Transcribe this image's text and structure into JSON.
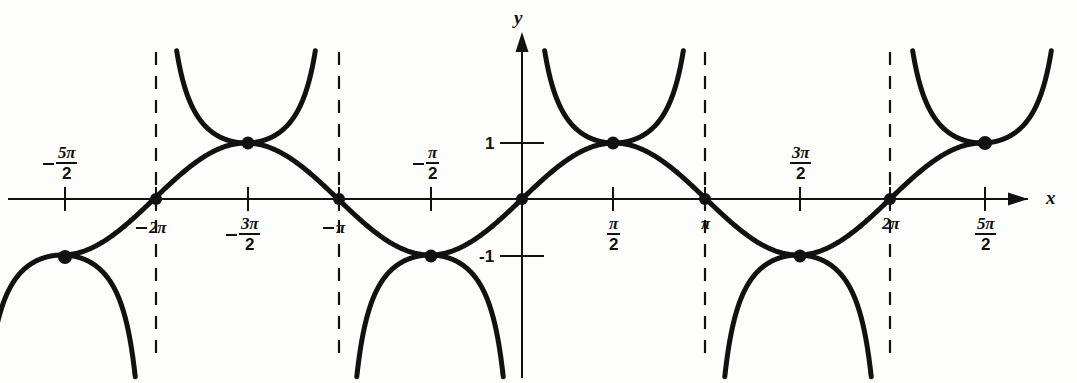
{
  "figure": {
    "background_color": "#fdfdfb",
    "ink_color": "#111111",
    "width": 1077,
    "height": 383
  },
  "axes": {
    "x_axis_name": "x",
    "y_axis_name": "y",
    "origin_px": {
      "x": 522,
      "y": 199
    },
    "pixels_per_half_pi": 92,
    "pixels_per_unit_y": 56,
    "x_range_pi": [
      -3.0,
      3.0
    ],
    "y_range": [
      -3.2,
      2.7
    ],
    "grid": false
  },
  "x_ticks": [
    {
      "id": "neg-5pi-2",
      "label_parts": {
        "sign": "-",
        "numerator": "5π",
        "denominator": "2"
      },
      "label_text": "-5π/2",
      "x_px": 65,
      "value_pi": -2.5,
      "label_side": "above"
    },
    {
      "id": "neg-2pi",
      "label_parts": {
        "sign": "-",
        "numerator": "2π",
        "denominator": ""
      },
      "label_text": "-2π",
      "x_px": 156,
      "value_pi": -2.0,
      "label_side": "below"
    },
    {
      "id": "neg-3pi-2",
      "label_parts": {
        "sign": "-",
        "numerator": "3π",
        "denominator": "2"
      },
      "label_text": "-3π/2",
      "x_px": 248,
      "value_pi": -1.5,
      "label_side": "below"
    },
    {
      "id": "neg-pi",
      "label_parts": {
        "sign": "-",
        "numerator": "π",
        "denominator": ""
      },
      "label_text": "-π",
      "x_px": 339,
      "value_pi": -1.0,
      "label_side": "below"
    },
    {
      "id": "neg-pi-2",
      "label_parts": {
        "sign": "-",
        "numerator": "π",
        "denominator": "2"
      },
      "label_text": "-π/2",
      "x_px": 431,
      "value_pi": -0.5,
      "label_side": "above"
    },
    {
      "id": "pos-pi-2",
      "label_parts": {
        "sign": "",
        "numerator": "π",
        "denominator": "2"
      },
      "label_text": "π/2",
      "x_px": 613,
      "value_pi": 0.5,
      "label_side": "below"
    },
    {
      "id": "pos-pi",
      "label_parts": {
        "sign": "",
        "numerator": "π",
        "denominator": ""
      },
      "label_text": "π",
      "x_px": 705,
      "value_pi": 1.0,
      "label_side": "below"
    },
    {
      "id": "pos-3pi-2",
      "label_parts": {
        "sign": "",
        "numerator": "3π",
        "denominator": "2"
      },
      "label_text": "3π/2",
      "x_px": 800,
      "value_pi": 1.5,
      "label_side": "above"
    },
    {
      "id": "pos-2pi",
      "label_parts": {
        "sign": "",
        "numerator": "2π",
        "denominator": ""
      },
      "label_text": "2π",
      "x_px": 890,
      "value_pi": 2.0,
      "label_side": "below"
    },
    {
      "id": "pos-5pi-2",
      "label_parts": {
        "sign": "",
        "numerator": "5π",
        "denominator": "2"
      },
      "label_text": "5π/2",
      "x_px": 985,
      "value_pi": 2.5,
      "label_side": "below"
    }
  ],
  "y_ticks": [
    {
      "id": "y-pos-1",
      "label_text": "1",
      "value": 1,
      "y_px": 143
    },
    {
      "id": "y-neg-1",
      "label_text": "-1",
      "value": -1,
      "y_px": 256
    }
  ],
  "asymptotes": {
    "style": "dashed",
    "label": "vertical asymptotes of csc x",
    "x_values_pi": [
      -2.0,
      -1.0,
      1.0,
      2.0
    ],
    "x_px": [
      156,
      339,
      705,
      890
    ],
    "top_px": 52,
    "bottom_px": 356
  },
  "tangency_points": [
    {
      "label": "(-3π/2, 1)",
      "x_px": 248,
      "y_px": 143
    },
    {
      "label": "(-π/2, -1)",
      "x_px": 431,
      "y_px": 256
    },
    {
      "label": "(π/2, 1)",
      "x_px": 613,
      "y_px": 143
    },
    {
      "label": "(3π/2, -1)",
      "x_px": 800,
      "y_px": 256
    }
  ],
  "intercept_points": [
    {
      "label": "(-2π, 0)",
      "x_px": 156,
      "y_px": 199
    },
    {
      "label": "(-π, 0)",
      "x_px": 339,
      "y_px": 199
    },
    {
      "label": "(0, 0)",
      "x_px": 522,
      "y_px": 199
    },
    {
      "label": "(π, 0)",
      "x_px": 705,
      "y_px": 199
    },
    {
      "label": "(2π, 0)",
      "x_px": 890,
      "y_px": 199
    }
  ],
  "endpoint_points": [
    {
      "label": "(-5π/2, -1)",
      "x_px": 65,
      "y_px": 257
    },
    {
      "label": "(5π/2, 1)",
      "x_px": 985,
      "y_px": 143
    }
  ],
  "chart_data": {
    "type": "line",
    "xlabel": "x",
    "ylabel": "y",
    "xlim_pi": [
      -3.0,
      3.0
    ],
    "ylim": [
      -3.2,
      2.7
    ],
    "grid": false,
    "legend_position": "none",
    "xtick_labels": [
      "-5π/2",
      "-2π",
      "-3π/2",
      "-π",
      "-π/2",
      "π/2",
      "π",
      "3π/2",
      "2π",
      "5π/2"
    ],
    "xtick_values_pi": [
      -2.5,
      -2.0,
      -1.5,
      -1.0,
      -0.5,
      0.5,
      1.0,
      1.5,
      2.0,
      2.5
    ],
    "ytick_labels": [
      "1",
      "-1"
    ],
    "ytick_values": [
      1,
      -1
    ],
    "series": [
      {
        "name": "y = sin x",
        "kind": "sine",
        "amplitude": 1,
        "period_pi": 2,
        "domain_pi": [
          -2.5,
          2.5
        ],
        "style": "solid",
        "sampled_points_pi_y": [
          [
            -2.5,
            -1.0
          ],
          [
            -2.25,
            -0.707
          ],
          [
            -2.0,
            0.0
          ],
          [
            -1.75,
            0.707
          ],
          [
            -1.5,
            1.0
          ],
          [
            -1.25,
            0.707
          ],
          [
            -1.0,
            0.0
          ],
          [
            -0.75,
            -0.707
          ],
          [
            -0.5,
            -1.0
          ],
          [
            -0.25,
            -0.707
          ],
          [
            0.0,
            0.0
          ],
          [
            0.25,
            0.707
          ],
          [
            0.5,
            1.0
          ],
          [
            0.75,
            0.707
          ],
          [
            1.0,
            0.0
          ],
          [
            1.25,
            -0.707
          ],
          [
            1.5,
            -1.0
          ],
          [
            1.75,
            -0.707
          ],
          [
            2.0,
            0.0
          ],
          [
            2.25,
            0.707
          ],
          [
            2.5,
            1.0
          ]
        ]
      },
      {
        "name": "y = csc x",
        "kind": "cosecant",
        "style": "solid",
        "asymptotes_pi": [
          -2.0,
          -1.0,
          0.0,
          1.0,
          2.0
        ],
        "branch_domains_pi": [
          [
            -3.0,
            -2.0
          ],
          [
            -2.0,
            -1.0
          ],
          [
            -1.0,
            0.0
          ],
          [
            0.0,
            1.0
          ],
          [
            1.0,
            2.0
          ],
          [
            2.0,
            3.0
          ]
        ],
        "branch_extrema_pi_y": [
          [
            -2.5,
            -1.0
          ],
          [
            -1.5,
            1.0
          ],
          [
            -0.5,
            -1.0
          ],
          [
            0.5,
            1.0
          ],
          [
            1.5,
            -1.0
          ],
          [
            2.5,
            1.0
          ]
        ]
      }
    ],
    "annotations": [
      "sin x and csc x are tangent at every extremum of sin x",
      "csc x has vertical asymptotes wherever sin x = 0"
    ]
  }
}
